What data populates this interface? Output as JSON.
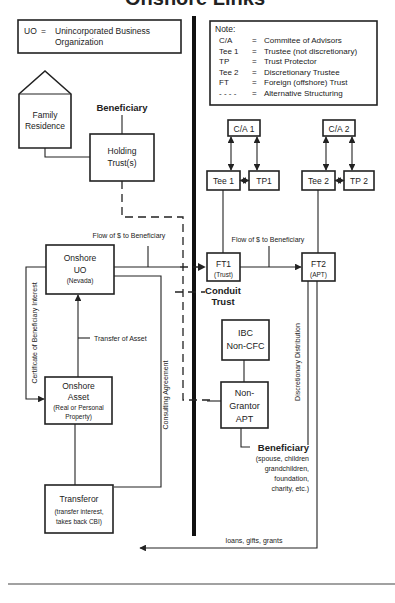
{
  "title": "Onshore Links",
  "legend_left": {
    "abbr": "UO",
    "eq": "=",
    "line1": "Unincorporated Business",
    "line2": "Organization"
  },
  "legend_right": {
    "heading": "Note:",
    "rows": [
      {
        "abbr": "C/A",
        "eq": "=",
        "desc": "Commitee of Advisors"
      },
      {
        "abbr": "Tee 1",
        "eq": "=",
        "desc": "Trustee (not discretionary)"
      },
      {
        "abbr": "TP",
        "eq": "=",
        "desc": "Trust Protector"
      },
      {
        "abbr": "Tee 2",
        "eq": "=",
        "desc": "Discretionary Trustee"
      },
      {
        "abbr": "FT",
        "eq": "=",
        "desc": "Foreign (offshore) Trust"
      },
      {
        "abbr": "- - - -",
        "eq": "=",
        "desc": "Alternative Structuring"
      }
    ]
  },
  "nodes": {
    "family_residence": {
      "line1": "Family",
      "line2": "Residence"
    },
    "beneficiary_top": "Beneficiary",
    "holding_trust": {
      "line1": "Holding",
      "line2": "Trust(s)"
    },
    "ca1": "C/A 1",
    "ca2": "C/A 2",
    "tee1": "Tee 1",
    "tp1": "TP1",
    "tee2": "Tee 2",
    "tp2": "TP 2",
    "onshore_uo": {
      "line1": "Onshore",
      "line2": "UO",
      "line3": "(Nevada)"
    },
    "ft1": {
      "line1": "FT1",
      "line2": "(Trust)"
    },
    "ft2": {
      "line1": "FT2",
      "line2": "(APT)"
    },
    "conduit_trust": {
      "line1": "Conduit",
      "line2": "Trust"
    },
    "ibc": {
      "line1": "IBC",
      "line2": "Non-CFC"
    },
    "onshore_asset": {
      "line1": "Onshore",
      "line2": "Asset",
      "line3": "(Real or Personal",
      "line4": "Property)"
    },
    "non_grantor": {
      "line1": "Non-",
      "line2": "Grantor",
      "line3": "APT"
    },
    "beneficiary_bottom": {
      "label": "Beneficiary",
      "line1": "(spouse, children",
      "line2": "grandchildren,",
      "line3": "foundation,",
      "line4": "charity, etc.)"
    },
    "transferor": {
      "line1": "Transferor",
      "line2": "(transfer interest,",
      "line3": "takes back CBI)"
    }
  },
  "edge_labels": {
    "flow_left": "Flow of $ to Beneficiary",
    "flow_right": "Flow of $ to Beneficiary",
    "transfer_asset": "Transfer of Asset",
    "certificate": "Certificate of Beneficiary Interest",
    "consulting": "Consulting Agreement",
    "discretionary": "Discretionary Distribution",
    "loans": "loans, gifts, grants"
  }
}
